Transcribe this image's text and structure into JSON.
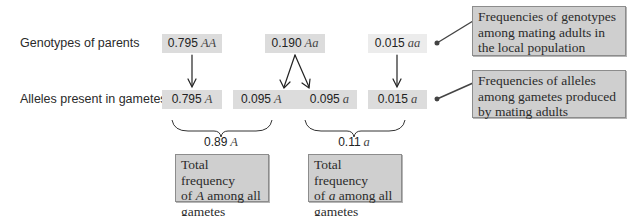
{
  "rows": {
    "parents_label": "Genotypes of parents",
    "gametes_label": "Alleles present in gametes"
  },
  "genotypes": [
    {
      "value": "0.795",
      "genotype": "AA"
    },
    {
      "value": "0.190",
      "genotype": "Aa"
    },
    {
      "value": "0.015",
      "genotype": "aa"
    }
  ],
  "gametes": [
    {
      "value": "0.795",
      "allele": "A"
    },
    {
      "value": "0.095",
      "allele": "A"
    },
    {
      "value": "0.095",
      "allele": "a"
    },
    {
      "value": "0.015",
      "allele": "a"
    }
  ],
  "totals": [
    {
      "value": "0.89",
      "allele": "A"
    },
    {
      "value": "0.11",
      "allele": "a"
    }
  ],
  "callouts": {
    "genotype_note": {
      "lines": [
        "Frequencies of genotypes",
        "among mating adults in",
        "the local population"
      ]
    },
    "allele_note": {
      "lines": [
        "Frequencies of alleles",
        "among gametes produced",
        "by mating adults"
      ]
    },
    "total_A_note": {
      "line1": "Total frequency",
      "line2_pre": "of ",
      "line2_sym": "A",
      "line2_post": " among all",
      "line3": "gametes"
    },
    "total_a_note": {
      "line1": "Total frequency",
      "line2_pre": "of ",
      "line2_sym": "a",
      "line2_post": " among all",
      "line3": "gametes"
    }
  },
  "colors": {
    "value_box": "#dcdcdc",
    "value_box_light": "#ececec",
    "callout_fill": "#cfcfcf",
    "callout_border": "#8c8c8c",
    "arrow": "#222222"
  }
}
